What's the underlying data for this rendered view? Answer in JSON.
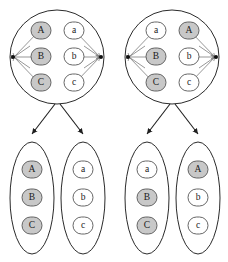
{
  "figure": {
    "title": "",
    "background_color": "#ffffff",
    "node_shaded_color": "#c8c8c8",
    "node_plain_color": "#ffffff",
    "node_stroke_color": "#555555",
    "container_stroke_color": "#2b2b2b",
    "edge_color": "#6a6a6a",
    "tree_edge_color": "#1f1f1f",
    "hub_dot_color": "#111111"
  },
  "groups": [
    {
      "id": "left-group",
      "name": "left-partition-diagram",
      "top_container": {
        "shape": "circle",
        "left_column": [
          {
            "label": "A",
            "shaded": true
          },
          {
            "label": "B",
            "shaded": true
          },
          {
            "label": "C",
            "shaded": true
          }
        ],
        "right_column": [
          {
            "label": "a",
            "shaded": false
          },
          {
            "label": "b",
            "shaded": false
          },
          {
            "label": "c",
            "shaded": false
          }
        ]
      },
      "child_containers": [
        {
          "shape": "ellipse",
          "items": [
            {
              "label": "A",
              "shaded": true
            },
            {
              "label": "B",
              "shaded": true
            },
            {
              "label": "C",
              "shaded": true
            }
          ]
        },
        {
          "shape": "ellipse",
          "items": [
            {
              "label": "a",
              "shaded": false
            },
            {
              "label": "b",
              "shaded": false
            },
            {
              "label": "c",
              "shaded": false
            }
          ]
        }
      ]
    },
    {
      "id": "right-group",
      "name": "right-partition-diagram",
      "top_container": {
        "shape": "circle",
        "left_column": [
          {
            "label": "a",
            "shaded": false
          },
          {
            "label": "B",
            "shaded": true
          },
          {
            "label": "C",
            "shaded": true
          }
        ],
        "right_column": [
          {
            "label": "A",
            "shaded": true
          },
          {
            "label": "b",
            "shaded": false
          },
          {
            "label": "c",
            "shaded": false
          }
        ]
      },
      "child_containers": [
        {
          "shape": "ellipse",
          "items": [
            {
              "label": "a",
              "shaded": false
            },
            {
              "label": "B",
              "shaded": true
            },
            {
              "label": "C",
              "shaded": true
            }
          ]
        },
        {
          "shape": "ellipse",
          "items": [
            {
              "label": "A",
              "shaded": true
            },
            {
              "label": "b",
              "shaded": false
            },
            {
              "label": "c",
              "shaded": false
            }
          ]
        }
      ]
    }
  ]
}
